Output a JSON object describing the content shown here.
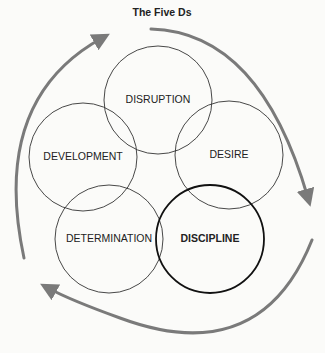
{
  "title": "The Five Ds",
  "colors": {
    "arrow": "#7a7a7a",
    "circle": "#333333",
    "background": "#fbfbf9"
  },
  "nodes": [
    {
      "label": "DISRUPTION",
      "cx": 158,
      "cy": 100,
      "r": 54,
      "emphasis": false
    },
    {
      "label": "DEVELOPMENT",
      "cx": 83,
      "cy": 157,
      "r": 54,
      "emphasis": false
    },
    {
      "label": "DESIRE",
      "cx": 229,
      "cy": 155,
      "r": 54,
      "emphasis": false
    },
    {
      "label": "DETERMINATION",
      "cx": 109,
      "cy": 239,
      "r": 54,
      "emphasis": false
    },
    {
      "label": "DISCIPLINE",
      "cx": 210,
      "cy": 239,
      "r": 54,
      "emphasis": true
    }
  ],
  "cycle": {
    "direction": "clockwise",
    "arrows": 3
  }
}
